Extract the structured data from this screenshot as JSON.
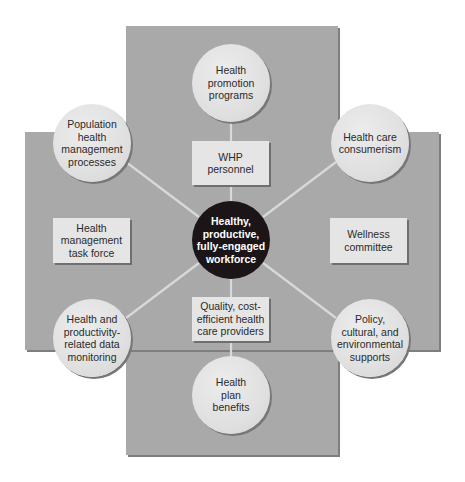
{
  "diagram": {
    "center": {
      "label": "Healthy,\nproductive,\nfully-engaged\nworkforce"
    },
    "outer_circles": [
      {
        "id": "top",
        "label": "Health\npromotion\nprograms"
      },
      {
        "id": "top-left",
        "label": "Population\nhealth\nmanagement\nprocesses"
      },
      {
        "id": "top-right",
        "label": "Health care\nconsumerism"
      },
      {
        "id": "bottom-left",
        "label": "Health and\nproductivity-\nrelated data\nmonitoring"
      },
      {
        "id": "bottom-right",
        "label": "Policy,\ncultural, and\nenvironmental\nsupports"
      },
      {
        "id": "bottom",
        "label": "Health\nplan\nbenefits"
      }
    ],
    "boxes": [
      {
        "id": "top",
        "label": "WHP\npersonnel"
      },
      {
        "id": "left",
        "label": "Health\nmanagement\ntask force"
      },
      {
        "id": "right",
        "label": "Wellness\ncommittee"
      },
      {
        "id": "bottom",
        "label": "Quality, cost-\nefficient health\ncare providers"
      }
    ],
    "colors": {
      "background_panel": "#a9a9a9",
      "circle_fill": "#e2e2e2",
      "box_fill": "#e5e5e5",
      "center_fill": "#1b1517",
      "connector": "#d9d9d9"
    }
  }
}
